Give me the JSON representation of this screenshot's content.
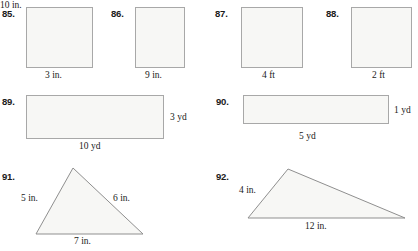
{
  "page": {
    "width": 418,
    "height": 251,
    "background_color": "#ffffff",
    "shape_fill_color": "#f7f7f5",
    "shape_stroke_color": "#a8a8a8",
    "text_color": "#1a1a1a"
  },
  "problems": [
    {
      "number": "85.",
      "shape": "square",
      "labels": {
        "bottom": "3 in."
      }
    },
    {
      "number": "86.",
      "shape": "square",
      "labels": {
        "bottom": "9 in."
      }
    },
    {
      "number": "87.",
      "shape": "square",
      "labels": {
        "bottom": "4 ft"
      }
    },
    {
      "number": "88.",
      "shape": "square",
      "labels": {
        "bottom": "2 ft"
      }
    },
    {
      "number": "89.",
      "shape": "rectangle",
      "labels": {
        "bottom": "10 yd",
        "right": "3 yd"
      }
    },
    {
      "number": "90.",
      "shape": "rectangle",
      "labels": {
        "bottom": "5 yd",
        "right": "1 yd"
      }
    },
    {
      "number": "91.",
      "shape": "triangle",
      "labels": {
        "left": "5 in.",
        "right": "6 in.",
        "bottom": "7 in."
      }
    },
    {
      "number": "92.",
      "shape": "triangle",
      "labels": {
        "left": "4 in.",
        "right": "10 in.",
        "bottom": "12 in."
      }
    }
  ]
}
